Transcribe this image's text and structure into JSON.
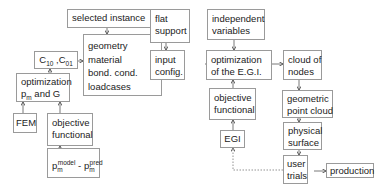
{
  "nodes": {
    "selected_instance": {
      "label": "selected instance"
    },
    "c10_c01": {
      "base1": "C",
      "sub1": "10",
      "sep": " ,",
      "base2": "C",
      "sub2": "01"
    },
    "geometry_block": {
      "lines": [
        "geometry",
        "material",
        "bond. cond.",
        "loadcases"
      ]
    },
    "optimization_pm_g": {
      "line1": "optimization",
      "p": "p",
      "p_sub": "m",
      "line2_rest": " and G"
    },
    "fem": {
      "label": "FEM"
    },
    "objective_functional_left": {
      "lines": [
        "objective",
        "functional"
      ]
    },
    "pm_diff": {
      "p": "p",
      "sub": "m",
      "sup1": "model",
      "minus": " - ",
      "sup2": "pred"
    },
    "flat_support": {
      "lines": [
        "flat",
        "support"
      ]
    },
    "input_config": {
      "lines": [
        "input",
        "config."
      ]
    },
    "independent_variables": {
      "lines": [
        "independent",
        "variables"
      ]
    },
    "optimization_egi": {
      "lines": [
        "optimization",
        "of the E.G.I."
      ]
    },
    "objective_functional_mid": {
      "lines": [
        "objective",
        "functional"
      ]
    },
    "egi": {
      "label": "EGI"
    },
    "cloud_of_nodes": {
      "lines": [
        "cloud of",
        "nodes"
      ]
    },
    "geometric_point_cloud": {
      "lines": [
        "geometric",
        "point cloud"
      ]
    },
    "physical_surface": {
      "lines": [
        "physical",
        "surface"
      ]
    },
    "user_trials": {
      "lines": [
        "user",
        "trials"
      ]
    },
    "production": {
      "label": "production"
    }
  },
  "colors": {
    "box_border": "#9a9a9a",
    "arrow": "#555555",
    "text": "#222222"
  }
}
